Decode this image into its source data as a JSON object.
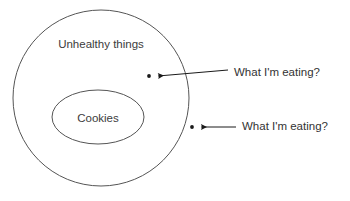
{
  "diagram": {
    "background_color": "#ffffff",
    "stroke_color": "#555555",
    "text_color": "#3a3a3a",
    "sets": {
      "outer": {
        "label": "Unhealthy things",
        "shape": "circle",
        "cx": 101,
        "cy": 98,
        "r": 88,
        "label_x": 101,
        "label_y": 45
      },
      "inner": {
        "label": "Cookies",
        "shape": "ellipse",
        "cx": 98,
        "cy": 117,
        "rx": 46,
        "ry": 27,
        "label_x": 98,
        "label_y": 119
      }
    },
    "points": [
      {
        "name": "point-inside",
        "x": 149,
        "y": 76,
        "radius": 2,
        "color": "#1a1a1a",
        "region": "inside-outer-circle"
      },
      {
        "name": "point-outside",
        "x": 192,
        "y": 127,
        "radius": 2,
        "color": "#1a1a1a",
        "region": "outside-outer-circle"
      }
    ],
    "annotations": [
      {
        "name": "annotation-top",
        "text": "What I'm eating?",
        "text_x": 234,
        "text_y": 73,
        "arrow_from_x": 228,
        "arrow_from_y": 70,
        "arrow_to_x": 156,
        "arrow_to_y": 76
      },
      {
        "name": "annotation-bottom",
        "text": "What I'm eating?",
        "text_x": 242,
        "text_y": 127,
        "arrow_from_x": 236,
        "arrow_from_y": 127,
        "arrow_to_x": 199,
        "arrow_to_y": 127
      }
    ]
  }
}
